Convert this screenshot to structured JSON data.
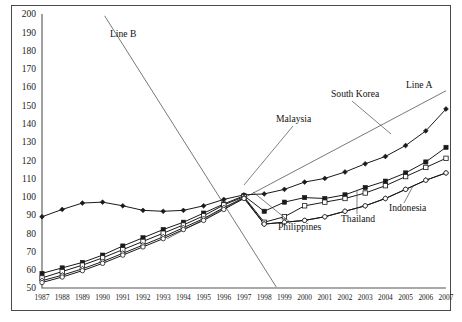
{
  "chart_data": {
    "type": "line",
    "title": "",
    "subtitle": "",
    "xlabel": "",
    "ylabel": "",
    "xlim": [
      1987,
      2007
    ],
    "ylim": [
      50,
      200
    ],
    "ytick_step": 10,
    "grid": false,
    "legend_position": "inline-annotations",
    "index_base_note": "",
    "categories": [
      "1987",
      "1988",
      "1989",
      "1990",
      "1991",
      "1992",
      "1993",
      "1994",
      "1995",
      "1996",
      "1997",
      "1998",
      "1999",
      "2000",
      "2001",
      "2002",
      "2003",
      "2004",
      "2005",
      "2006",
      "2007"
    ],
    "yticks": [
      50,
      60,
      70,
      80,
      90,
      100,
      110,
      120,
      130,
      140,
      150,
      160,
      170,
      180,
      190,
      200
    ],
    "series": [
      {
        "name": "South Korea",
        "marker": "filled-diamond",
        "values": [
          89,
          93,
          96.5,
          97,
          95,
          92.5,
          92,
          92.5,
          95,
          98.5,
          101,
          101.5,
          104,
          108,
          110,
          113.5,
          118,
          122,
          128,
          136,
          148
        ]
      },
      {
        "name": "Malaysia",
        "marker": "filled-square",
        "values": [
          58,
          61,
          64,
          68,
          73,
          77.5,
          82,
          86,
          91,
          96,
          100.5,
          92,
          97,
          99.5,
          99,
          101,
          105,
          108.5,
          113,
          119,
          127
        ]
      },
      {
        "name": "Thailand",
        "marker": "open-square",
        "values": [
          55.5,
          59,
          62.5,
          66.5,
          71,
          75.5,
          80,
          84.5,
          89.5,
          95.5,
          100,
          86,
          89,
          95,
          97,
          99,
          102,
          106,
          111,
          116,
          121
        ]
      },
      {
        "name": "Indonesia",
        "marker": "open-diamond",
        "values": [
          54,
          57,
          60.5,
          64.5,
          69,
          73.5,
          78,
          83,
          88,
          94,
          99.5,
          85,
          86,
          87,
          89,
          92,
          95,
          99,
          104,
          109,
          113
        ]
      },
      {
        "name": "Philippines",
        "marker": "open-circle",
        "values": [
          53,
          56,
          59.5,
          63.5,
          68,
          72.5,
          77,
          82,
          87,
          93,
          99,
          85,
          86,
          87,
          89,
          92,
          95,
          99,
          104,
          109,
          113
        ]
      }
    ],
    "reference_lines": [
      {
        "name": "Line A",
        "style": "straight-trend",
        "description": "Upward straight trend line",
        "x0": 1993.2,
        "y0": 77,
        "x1": 2007.0,
        "y1": 158
      },
      {
        "name": "Line B",
        "style": "straight-trend",
        "description": "Steep downward straight line",
        "x0": 1990.1,
        "y0": 199,
        "x1": 1998.6,
        "y1": 50.5
      }
    ],
    "annotations": [
      {
        "label": "Line B",
        "x": 110,
        "y": 37,
        "anchor": "start",
        "leader": null
      },
      {
        "label": "Line A",
        "x": 406,
        "y": 88,
        "anchor": "start",
        "leader": null
      },
      {
        "label": "South Korea",
        "x": 331,
        "y": 97,
        "anchor": "start",
        "leader": {
          "x1": 352,
          "y1": 101,
          "x2": 391,
          "y2": 134
        }
      },
      {
        "label": "Malaysia",
        "x": 276,
        "y": 122,
        "anchor": "start",
        "leader": {
          "x1": 293,
          "y1": 126,
          "x2": 244,
          "y2": 185
        }
      },
      {
        "label": "Philippines",
        "x": 278,
        "y": 230,
        "anchor": "start",
        "leader": {
          "x1": 290,
          "y1": 222,
          "x2": 253,
          "y2": 192
        }
      },
      {
        "label": "Thailand",
        "x": 341,
        "y": 222,
        "anchor": "start",
        "leader": {
          "x1": 357,
          "y1": 214,
          "x2": 357,
          "y2": 190
        }
      },
      {
        "label": "Indonesia",
        "x": 389,
        "y": 211,
        "anchor": "start",
        "leader": {
          "x1": 404,
          "y1": 203,
          "x2": 413,
          "y2": 186
        }
      }
    ]
  }
}
